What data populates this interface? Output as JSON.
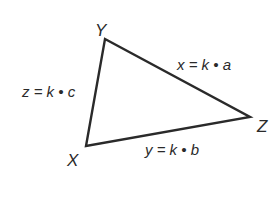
{
  "diagram": {
    "type": "triangle",
    "stroke_color": "#2a2a2a",
    "vertices": [
      {
        "name": "Y",
        "x": 105,
        "y": 39
      },
      {
        "name": "Z",
        "x": 250,
        "y": 117
      },
      {
        "name": "X",
        "x": 86,
        "y": 146
      }
    ],
    "vertex_labels": {
      "Y": "Y",
      "Z": "Z",
      "X": "X"
    },
    "edge_labels": {
      "YZ": "x = k • a",
      "XY": "z = k • c",
      "XZ": "y = k • b"
    }
  }
}
